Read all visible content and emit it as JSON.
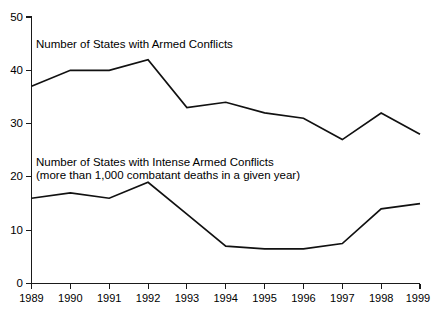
{
  "chart_data": {
    "type": "line",
    "title": "",
    "subtitle": "",
    "xlabel": "",
    "ylabel": "",
    "x": [
      1989,
      1990,
      1991,
      1992,
      1993,
      1994,
      1995,
      1996,
      1997,
      1998,
      1999
    ],
    "categories": [
      "1989",
      "1990",
      "1991",
      "1992",
      "1993",
      "1994",
      "1995",
      "1996",
      "1997",
      "1998",
      "1999"
    ],
    "xlim": [
      1989,
      1999
    ],
    "ylim": [
      0,
      50
    ],
    "yticks": [
      0,
      10,
      20,
      30,
      40,
      50
    ],
    "ytick_labels": [
      "0",
      "10",
      "20",
      "30",
      "40",
      "50"
    ],
    "grid": false,
    "legend_position": "inline-annotation",
    "series": [
      {
        "name": "Number of States with Armed Conflicts",
        "values": [
          37,
          40,
          40,
          42,
          33,
          34,
          32,
          31,
          27,
          32,
          28
        ],
        "color": "#111111"
      },
      {
        "name": "Number of States with Intense Armed Conflicts (more than 1,000 combatant deaths in a given year)",
        "values": [
          16,
          17,
          16,
          19,
          13,
          7,
          6.5,
          6.5,
          7.5,
          14,
          15
        ],
        "color": "#111111"
      }
    ],
    "annotations": [
      {
        "id": "upper-series-label",
        "lines": [
          "Number of States with Armed Conflicts"
        ],
        "x": 1989.35,
        "y": 44.2
      },
      {
        "id": "lower-series-label",
        "lines": [
          "Number of States with Intense Armed Conflicts",
          "(more than 1,000 combatant deaths in a given year)"
        ],
        "x": 1989.35,
        "y": 22.6
      }
    ]
  },
  "axes": {
    "y_axis_name": "y-axis",
    "x_axis_name": "x-axis"
  }
}
